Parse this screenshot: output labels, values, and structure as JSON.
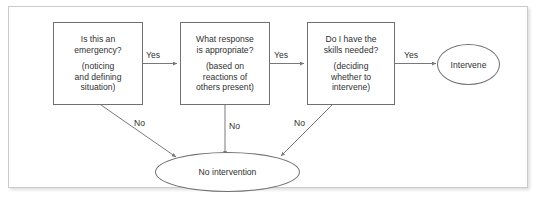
{
  "diagram": {
    "type": "flowchart",
    "nodes": [
      {
        "id": "emergency",
        "shape": "rectangle",
        "question": "Is this an\nemergency?",
        "detail": "(noticing\nand defining\nsituation)"
      },
      {
        "id": "response",
        "shape": "rectangle",
        "question": "What response\nis appropriate?",
        "detail": "(based on\nreactions of\nothers present)"
      },
      {
        "id": "skills",
        "shape": "rectangle",
        "question": "Do I have the\nskills needed?",
        "detail": "(deciding\nwhether to\nintervene)"
      },
      {
        "id": "intervene",
        "shape": "ellipse",
        "label": "Intervene"
      },
      {
        "id": "no-intervention",
        "shape": "ellipse",
        "label": "No intervention"
      }
    ],
    "edge_labels": {
      "yes_1": "Yes",
      "yes_2": "Yes",
      "yes_3": "Yes",
      "no_1": "No",
      "no_2": "No",
      "no_3": "No"
    },
    "colors": {
      "stroke": "#6e7072",
      "connector": "#76797b",
      "text": "#2f3132",
      "frame_border": "#c9cbcc",
      "background": "#ffffff"
    }
  }
}
